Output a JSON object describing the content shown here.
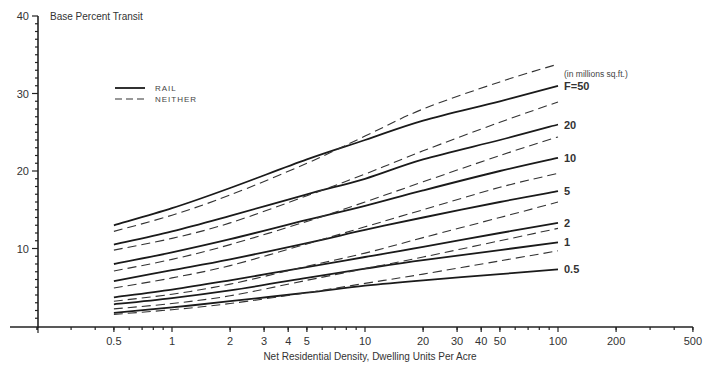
{
  "chart_data": {
    "type": "line",
    "title": "",
    "ylabel": "Base Percent Transit",
    "xlabel": "Net Residential Density, Dwelling Units Per Acre",
    "xscale": "log",
    "xlim": [
      0.2,
      500
    ],
    "ylim": [
      0,
      40
    ],
    "grid": false,
    "y_ticks": [
      10,
      20,
      30,
      40
    ],
    "y_tick_labels": [
      "10",
      "20",
      "30",
      "40"
    ],
    "x_ticks": [
      0.5,
      1,
      2,
      3,
      4,
      5,
      10,
      20,
      30,
      40,
      50,
      100,
      200,
      500
    ],
    "x_tick_labels": [
      "0.5",
      "1",
      "2",
      "3",
      "4",
      "5",
      "10",
      "20",
      "30",
      "40",
      "50",
      "100",
      "200",
      "500"
    ],
    "legend": {
      "position": "upper-left",
      "entries": [
        {
          "label": "RAIL",
          "style": "solid"
        },
        {
          "label": "NEITHER",
          "style": "dashed"
        }
      ]
    },
    "annotations": {
      "units_note": "(in millions sq.ft.)",
      "curve_labels": [
        "F=50",
        "20",
        "10",
        "5",
        "2",
        "1",
        "0.5"
      ]
    },
    "x": [
      0.5,
      1,
      2,
      5,
      10,
      20,
      50,
      100
    ],
    "series": [
      {
        "name": "RAIL F=50",
        "group": "RAIL",
        "F": 50,
        "label": "F=50",
        "values": [
          13.0,
          15.2,
          17.8,
          21.5,
          24.0,
          26.5,
          29.0,
          31.0
        ]
      },
      {
        "name": "RAIL F=20",
        "group": "RAIL",
        "F": 20,
        "label": "20",
        "values": [
          10.5,
          12.2,
          14.2,
          17.0,
          19.0,
          21.5,
          24.0,
          26.0
        ]
      },
      {
        "name": "RAIL F=10",
        "group": "RAIL",
        "F": 10,
        "label": "10",
        "values": [
          8.0,
          9.5,
          11.2,
          13.7,
          15.5,
          17.5,
          20.0,
          21.7
        ]
      },
      {
        "name": "RAIL F=5",
        "group": "RAIL",
        "F": 5,
        "label": "5",
        "values": [
          5.8,
          7.2,
          8.6,
          10.7,
          12.4,
          14.0,
          16.0,
          17.4
        ]
      },
      {
        "name": "RAIL F=2",
        "group": "RAIL",
        "F": 2,
        "label": "2",
        "values": [
          3.7,
          4.7,
          5.9,
          7.6,
          8.9,
          10.2,
          12.0,
          13.3
        ]
      },
      {
        "name": "RAIL F=1",
        "group": "RAIL",
        "F": 1,
        "label": "1",
        "values": [
          2.8,
          3.6,
          4.6,
          6.2,
          7.4,
          8.5,
          9.8,
          10.8
        ]
      },
      {
        "name": "RAIL F=0.5",
        "group": "RAIL",
        "F": 0.5,
        "label": "0.5",
        "values": [
          1.7,
          2.4,
          3.2,
          4.3,
          5.2,
          5.9,
          6.7,
          7.3
        ]
      },
      {
        "name": "NEITHER F=50",
        "group": "NEITHER",
        "F": 50,
        "values": [
          12.2,
          14.3,
          16.9,
          21.0,
          24.5,
          28.0,
          31.5,
          33.8
        ]
      },
      {
        "name": "NEITHER F=20",
        "group": "NEITHER",
        "F": 20,
        "values": [
          9.8,
          11.3,
          13.3,
          16.8,
          19.6,
          22.6,
          26.3,
          28.9
        ]
      },
      {
        "name": "NEITHER F=10",
        "group": "NEITHER",
        "F": 10,
        "values": [
          7.1,
          8.6,
          10.5,
          13.5,
          16.0,
          18.6,
          22.0,
          24.4
        ]
      },
      {
        "name": "NEITHER F=5",
        "group": "NEITHER",
        "F": 5,
        "values": [
          4.9,
          6.2,
          7.8,
          10.6,
          12.8,
          15.0,
          17.9,
          19.7
        ]
      },
      {
        "name": "NEITHER F=2",
        "group": "NEITHER",
        "F": 2,
        "values": [
          3.2,
          4.1,
          5.4,
          7.7,
          9.4,
          11.4,
          14.0,
          16.0
        ]
      },
      {
        "name": "NEITHER F=1",
        "group": "NEITHER",
        "F": 1,
        "values": [
          2.2,
          2.9,
          3.9,
          5.9,
          7.4,
          8.9,
          11.0,
          12.6
        ]
      },
      {
        "name": "NEITHER F=0.5",
        "group": "NEITHER",
        "F": 0.5,
        "values": [
          1.5,
          2.1,
          2.9,
          4.3,
          5.5,
          6.7,
          8.4,
          9.7
        ]
      }
    ]
  },
  "colors": {
    "line": "#1a1a1a",
    "text": "#333333",
    "background": "#ffffff"
  }
}
